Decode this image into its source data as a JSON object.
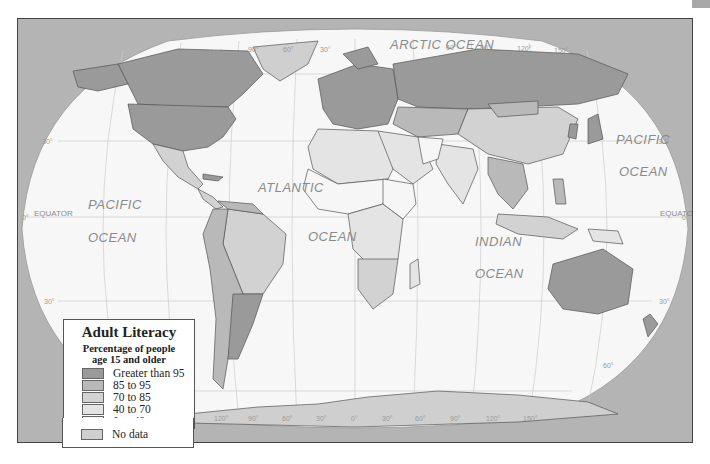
{
  "map": {
    "title": "Adult Literacy",
    "subtitle_line1": "Percentage of people",
    "subtitle_line2": "age 15 and older",
    "colors": {
      "background_frame": "#b4b4b4",
      "ocean": "#f7f7f7",
      "graticule": "#c8c8c8",
      "border": "#555555"
    },
    "legend": [
      {
        "label": "Greater than 95",
        "color": "#9a9a9a"
      },
      {
        "label": "85 to 95",
        "color": "#b9b9b9"
      },
      {
        "label": "70 to 85",
        "color": "#d2d2d2"
      },
      {
        "label": "40 to 70",
        "color": "#e4e4e4"
      },
      {
        "label": "0 to 40",
        "color": "#f6f6f6"
      }
    ],
    "no_data": {
      "label": "No data",
      "color": "#cfcfcf"
    },
    "ocean_labels": {
      "arctic": "ARCTIC OCEAN",
      "pacific_west_1": "PACIFIC",
      "pacific_west_2": "OCEAN",
      "atlantic_1": "ATLANTIC",
      "atlantic_2": "OCEAN",
      "indian_1": "INDIAN",
      "indian_2": "OCEAN",
      "pacific_east_1": "PACIFIC",
      "pacific_east_2": "OCEAN"
    },
    "equator_label": "EQUATOR",
    "graticule_labels": {
      "top_longitudes": [
        "150°",
        "120°",
        "90°",
        "60°",
        "30°",
        "60°",
        "90°",
        "120°",
        "150°"
      ],
      "bottom_longitudes": [
        "150°",
        "120°",
        "90°",
        "60°",
        "30°",
        "0°",
        "30°",
        "60°",
        "90°",
        "120°",
        "150°"
      ],
      "latitudes_left": [
        "60°",
        "30°",
        "0°",
        "30°"
      ],
      "latitudes_right": [
        "30°",
        "0°",
        "30°",
        "60°"
      ]
    }
  }
}
